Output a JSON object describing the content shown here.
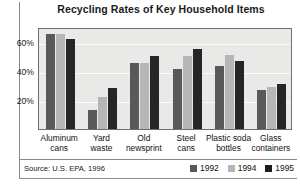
{
  "chart_data": {
    "type": "bar",
    "title": "Recycling Rates of Key Household Items",
    "xlabel": "",
    "ylabel": "",
    "ylim": [
      0,
      70
    ],
    "grid": true,
    "yticks": [
      "20%",
      "40%",
      "60%"
    ],
    "ytick_values": [
      20,
      40,
      60
    ],
    "legend_position": "bottom-right",
    "categories": [
      "Aluminum cans",
      "Yard waste",
      "Old newsprint",
      "Steel cans",
      "Plastic soda bottles",
      "Glass containers"
    ],
    "category_lines": [
      {
        "l1": "Aluminum",
        "l2": "cans"
      },
      {
        "l1": "Yard",
        "l2": "waste"
      },
      {
        "l1": "Old",
        "l2": "newsprint"
      },
      {
        "l1": "Steel",
        "l2": "cans"
      },
      {
        "l1": "Plastic soda",
        "l2": "bottles"
      },
      {
        "l1": "Glass",
        "l2": "containers"
      }
    ],
    "series": [
      {
        "name": "1992",
        "color": "#595959",
        "values": [
          65,
          13,
          45,
          41,
          43,
          27
        ]
      },
      {
        "name": "1994",
        "color": "#b6b6b6",
        "values": [
          65,
          22,
          45,
          50,
          51,
          29
        ]
      },
      {
        "name": "1995",
        "color": "#262626",
        "values": [
          62,
          28,
          50,
          55,
          47,
          31
        ]
      }
    ],
    "source": "Source: U.S. EPA, 1996"
  },
  "legend": {
    "items": [
      {
        "label": "1992"
      },
      {
        "label": "1994"
      },
      {
        "label": "1995"
      }
    ]
  }
}
